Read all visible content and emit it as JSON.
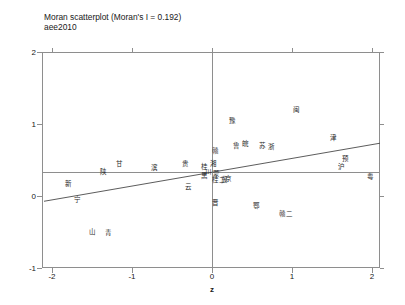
{
  "figure": {
    "title": "Moran scatterplot (Moran's I = 0.192)",
    "subtitle": "aee2010",
    "caption": ""
  },
  "axes": {
    "x_title": "z",
    "x_ticks": [
      "-2",
      "-1",
      "0",
      "1",
      "2"
    ],
    "y_ticks": [
      "-1",
      "0",
      "1",
      "2"
    ]
  },
  "chart_data": {
    "type": "scatter",
    "title": "Moran scatterplot (Moran's I = 0.192)",
    "subtitle": "aee2010",
    "xlabel": "z",
    "ylabel": "",
    "xlim": [
      -2.1,
      2.1
    ],
    "ylim": [
      -1.2,
      2.1
    ],
    "grid": false,
    "legend": null,
    "morans_i": 0.192,
    "mean_line_y": 0.33,
    "mean_line_x": 0.0,
    "fit_line": {
      "slope": 0.192,
      "intercept": 0.33,
      "x_from": -2.1,
      "x_to": 2.1
    },
    "point_label_type": "province-abbreviation",
    "points": [
      {
        "label": "新",
        "x": -1.79,
        "y": 0.16
      },
      {
        "label": "宁",
        "x": -1.68,
        "y": -0.05
      },
      {
        "label": "陕",
        "x": -1.36,
        "y": 0.33
      },
      {
        "label": "甘",
        "x": -1.16,
        "y": 0.44
      },
      {
        "label": "山",
        "x": -1.5,
        "y": -0.5
      },
      {
        "label": "青",
        "x": -1.29,
        "y": -0.51
      },
      {
        "label": "贵",
        "x": -0.33,
        "y": 0.44
      },
      {
        "label": "云",
        "x": -0.3,
        "y": 0.12
      },
      {
        "label": "桂",
        "x": -0.1,
        "y": 0.4
      },
      {
        "label": "川",
        "x": -0.05,
        "y": 0.33
      },
      {
        "label": "黑",
        "x": -0.09,
        "y": 0.28
      },
      {
        "label": "湘",
        "x": 0.02,
        "y": 0.45
      },
      {
        "label": "赣",
        "x": 0.04,
        "y": 0.62
      },
      {
        "label": "蒙",
        "x": 0.06,
        "y": 0.31
      },
      {
        "label": "桂二",
        "x": 0.09,
        "y": 0.22
      },
      {
        "label": "冀",
        "x": 0.16,
        "y": 0.22
      },
      {
        "label": "晋",
        "x": 0.04,
        "y": -0.1
      },
      {
        "label": "鲁",
        "x": 0.3,
        "y": 0.7
      },
      {
        "label": "皖",
        "x": 0.42,
        "y": 0.72
      },
      {
        "label": "豫",
        "x": 0.26,
        "y": 1.04
      },
      {
        "label": "鄂",
        "x": 0.55,
        "y": -0.14
      },
      {
        "label": "闽",
        "x": 1.06,
        "y": 1.2
      },
      {
        "label": "津",
        "x": 1.52,
        "y": 0.8
      },
      {
        "label": "预",
        "x": 1.67,
        "y": 0.52
      },
      {
        "label": "沪",
        "x": 1.62,
        "y": 0.4
      },
      {
        "label": "粤",
        "x": 1.98,
        "y": 0.26
      },
      {
        "label": "赣二",
        "x": 0.92,
        "y": -0.25
      },
      {
        "label": "京",
        "x": 0.2,
        "y": 0.24
      },
      {
        "label": "浙",
        "x": 0.74,
        "y": 0.68
      },
      {
        "label": "苏",
        "x": 0.63,
        "y": 0.7
      },
      {
        "label": "滨",
        "x": -0.72,
        "y": 0.39
      }
    ]
  }
}
